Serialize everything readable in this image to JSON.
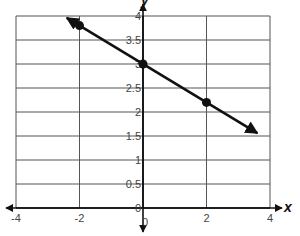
{
  "chart_data": {
    "type": "line",
    "title": "",
    "xlabel": "x",
    "ylabel": "y",
    "xlim": [
      -4,
      4
    ],
    "ylim": [
      0,
      4
    ],
    "grid": true,
    "x_ticks": [
      -4,
      -2,
      0,
      2,
      4
    ],
    "x_tick_labels": [
      "-4",
      "-2",
      "0",
      "2",
      "4"
    ],
    "y_ticks": [
      0,
      0.5,
      1,
      1.5,
      2,
      2.5,
      3,
      3.5,
      4
    ],
    "y_tick_labels": [
      "0",
      "0.5",
      "1",
      "1.5",
      "2",
      "2.5",
      "3",
      "3.5",
      "4"
    ],
    "series": [
      {
        "name": "line",
        "slope": -0.4,
        "intercept": 3,
        "arrows_both_ends": true,
        "x_extent": [
          -2.4,
          3.6
        ],
        "points": [
          {
            "x": -2,
            "y": 3.8
          },
          {
            "x": 0,
            "y": 3
          },
          {
            "x": 2,
            "y": 2.2
          }
        ]
      }
    ],
    "legend": null
  },
  "colors": {
    "grid": "#555555",
    "axis": "#111111",
    "line": "#111111",
    "tick_text": "#444444"
  }
}
